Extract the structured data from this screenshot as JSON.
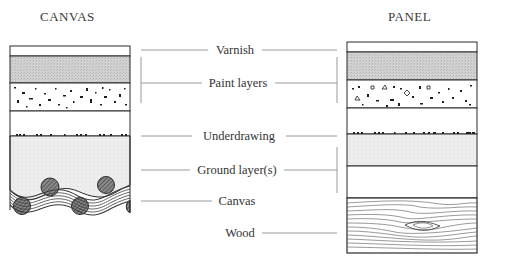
{
  "diagram": {
    "left_title": "CANVAS",
    "right_title": "PANEL",
    "labels": {
      "varnish": "Varnish",
      "paint_layers": "Paint layers",
      "underdrawing": "Underdrawing",
      "ground_layers": "Ground layer(s)",
      "canvas": "Canvas",
      "wood": "Wood"
    },
    "left_stack": [
      "Varnish",
      "Paint layers",
      "Underdrawing",
      "Ground layer(s)",
      "Canvas"
    ],
    "right_stack": [
      "Varnish",
      "Paint layers",
      "Underdrawing",
      "Ground layer(s)",
      "Wood"
    ],
    "colors": {
      "stroke": "#2a2a2a",
      "paint_fill": "#cfcfcf",
      "ground_fill": "#ececec",
      "leader_line": "#9a9a9a"
    }
  }
}
